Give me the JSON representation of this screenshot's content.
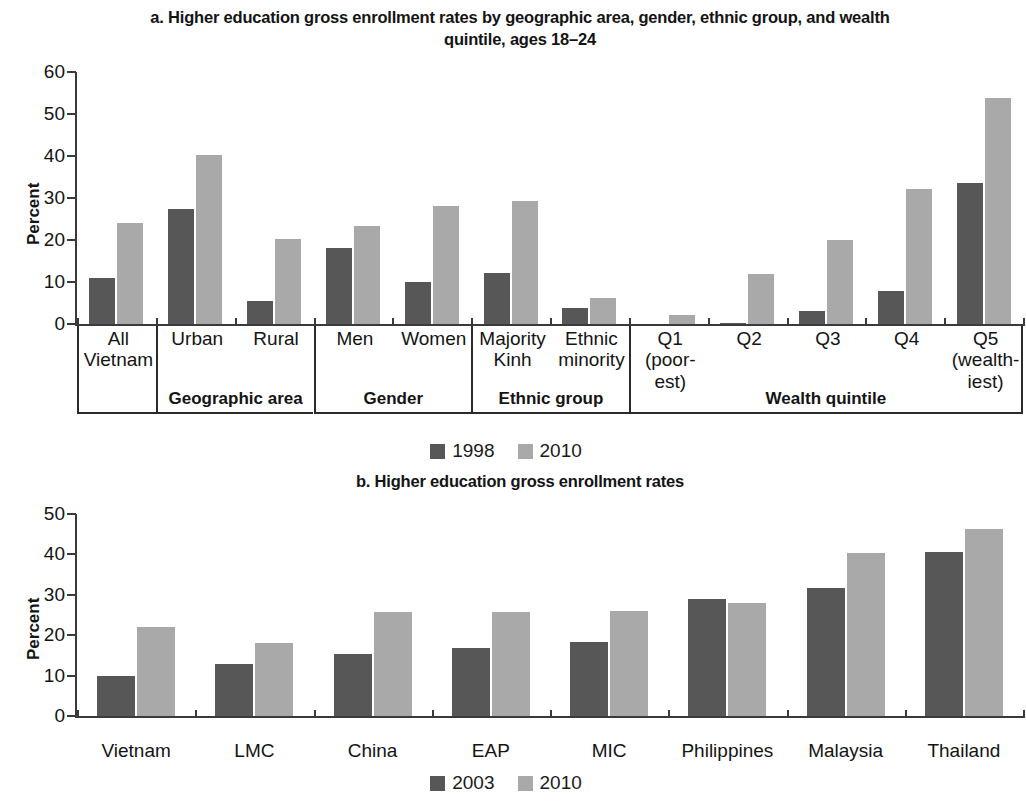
{
  "chart_data": [
    {
      "type": "bar",
      "id": "panel-a",
      "title": "a. Higher education gross enrollment rates by geographic area, gender, ethnic group, and wealth quintile, ages 18–24",
      "xlabel": "",
      "ylabel": "Percent",
      "ylim": [
        0,
        60
      ],
      "yticks": [
        0,
        10,
        20,
        30,
        40,
        50,
        60
      ],
      "grid": false,
      "legend_position": "bottom",
      "categories": [
        "All Vietnam",
        "Urban",
        "Rural",
        "Men",
        "Women",
        "Majority Kinh",
        "Ethnic minority",
        "Q1 (poor-est)",
        "Q2",
        "Q3",
        "Q4",
        "Q5 (wealth-iest)"
      ],
      "category_lines": [
        [
          "All",
          "Vietnam"
        ],
        [
          "Urban"
        ],
        [
          "Rural"
        ],
        [
          "Men"
        ],
        [
          "Women"
        ],
        [
          "Majority",
          "Kinh"
        ],
        [
          "Ethnic",
          "minority"
        ],
        [
          "Q1",
          "(poor-",
          "est)"
        ],
        [
          "Q2"
        ],
        [
          "Q3"
        ],
        [
          "Q4"
        ],
        [
          "Q5",
          "(wealth-",
          "iest)"
        ]
      ],
      "groups": [
        {
          "label": "",
          "span": 1
        },
        {
          "label": "Geographic area",
          "span": 2
        },
        {
          "label": "Gender",
          "span": 2
        },
        {
          "label": "Ethnic group",
          "span": 2
        },
        {
          "label": "Wealth quintile",
          "span": 5
        }
      ],
      "series": [
        {
          "name": "1998",
          "color": "#575757",
          "values": [
            11.0,
            27.3,
            5.4,
            18.1,
            10.0,
            12.2,
            3.8,
            0.0,
            0.3,
            3.0,
            7.8,
            33.6
          ]
        },
        {
          "name": "2010",
          "color": "#a9a9a9",
          "values": [
            24.0,
            40.2,
            20.2,
            23.3,
            28.1,
            29.3,
            6.3,
            2.1,
            12.0,
            20.1,
            32.1,
            53.8
          ]
        }
      ]
    },
    {
      "type": "bar",
      "id": "panel-b",
      "title": "b. Higher education gross enrollment rates",
      "xlabel": "",
      "ylabel": "Percent",
      "ylim": [
        0,
        50
      ],
      "yticks": [
        0,
        10,
        20,
        30,
        40,
        50
      ],
      "grid": false,
      "legend_position": "bottom",
      "categories": [
        "Vietnam",
        "LMC",
        "China",
        "EAP",
        "MIC",
        "Philippines",
        "Malaysia",
        "Thailand"
      ],
      "series": [
        {
          "name": "2003",
          "color": "#575757",
          "values": [
            9.9,
            12.8,
            15.4,
            16.8,
            18.2,
            28.9,
            31.6,
            40.7
          ]
        },
        {
          "name": "2010",
          "color": "#a9a9a9",
          "values": [
            22.1,
            18.0,
            25.8,
            25.8,
            26.0,
            28.0,
            40.3,
            46.2
          ]
        }
      ]
    }
  ],
  "panel_a": {
    "title": "a. Higher education gross enrollment rates by geographic area, gender, ethnic group, and wealth quintile, ages 18–24",
    "ylabel": "Percent",
    "legend": [
      {
        "label": "1998",
        "color": "#575757"
      },
      {
        "label": "2010",
        "color": "#a9a9a9"
      }
    ]
  },
  "panel_b": {
    "title": "b. Higher education gross enrollment rates",
    "ylabel": "Percent",
    "legend": [
      {
        "label": "2003",
        "color": "#575757"
      },
      {
        "label": "2010",
        "color": "#a9a9a9"
      }
    ]
  }
}
